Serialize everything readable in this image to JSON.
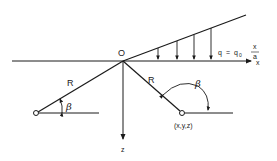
{
  "diagram": {
    "type": "load-on-half-space",
    "labels": {
      "origin": "O",
      "x_axis": "x",
      "z_axis": "z",
      "radius_left": "R",
      "radius_right": "R",
      "angle_left": "β",
      "angle_right": "β",
      "point": "(x,y,z)"
    },
    "load_formula": {
      "lhs": "q",
      "equals": "=",
      "coef": "q",
      "coef_sub": "0",
      "numerator": "x",
      "denominator": "a"
    },
    "load_arrows_count": 4,
    "colors": {
      "line": "#1a1a1a",
      "background": "#ffffff"
    }
  }
}
